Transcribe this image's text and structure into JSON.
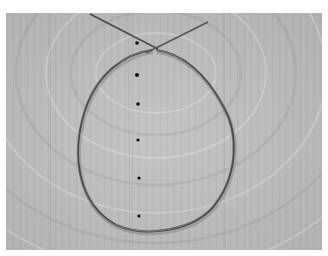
{
  "image": {
    "description": "Grayscale photo of a thin wire bent into a loop with crossed ends, lying on a wooden surface with a vertical row of dots",
    "colors": {
      "border": "#ffffff",
      "wood": "#bdbdbd",
      "wire": "#4a4a4a",
      "dots": "#111111"
    },
    "dots": [
      {
        "x": 131,
        "y": 30
      },
      {
        "x": 131,
        "y": 62
      },
      {
        "x": 132,
        "y": 91
      },
      {
        "x": 132,
        "y": 127
      },
      {
        "x": 133,
        "y": 165
      },
      {
        "x": 133,
        "y": 203
      }
    ]
  }
}
